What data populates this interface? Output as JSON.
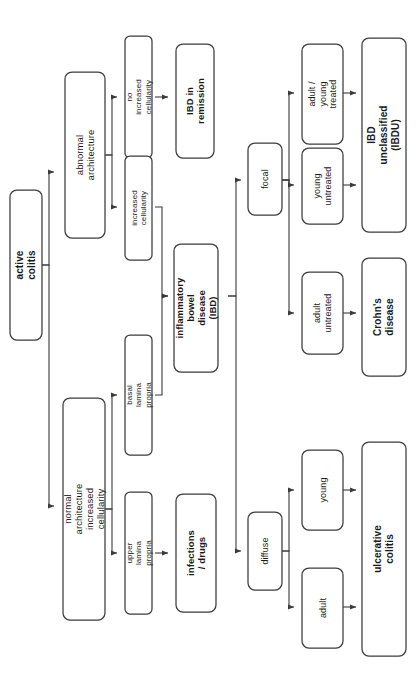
{
  "diagram": {
    "orientation": "rotated-90-ccw",
    "colors": {
      "background": "#ffffff",
      "node_stroke": "#3b3b3b",
      "node_fill": "#ffffff",
      "text": "#1a1a1a",
      "edge": "#3b3b3b"
    },
    "nodes": [
      {
        "id": "active_colitis",
        "label": "active colitis",
        "bold": true,
        "level": 0
      },
      {
        "id": "abnormal_arch",
        "label": "abnormal architecture",
        "bold": false,
        "level": 1
      },
      {
        "id": "normal_arch",
        "label": "normal architecture\nincreased cellularity",
        "bold": false,
        "level": 1
      },
      {
        "id": "no_incr_cell",
        "label": "no increased cellularity",
        "bold": false,
        "level": 2
      },
      {
        "id": "incr_cell",
        "label": "increased cellularity",
        "bold": false,
        "level": 2
      },
      {
        "id": "basal_lp",
        "label": "basal lamina propria",
        "bold": false,
        "level": 2
      },
      {
        "id": "upper_lp",
        "label": "upper lamina propria",
        "bold": false,
        "level": 2
      },
      {
        "id": "ibd_remission",
        "label": "IBD in remission",
        "bold": true,
        "level": 3
      },
      {
        "id": "ibd",
        "label": "inflammatory bowel\ndisease (IBD)",
        "bold": true,
        "level": 3
      },
      {
        "id": "infections_drugs",
        "label": "infections / drugs",
        "bold": true,
        "level": 3
      },
      {
        "id": "focal",
        "label": "focal",
        "bold": false,
        "level": 4
      },
      {
        "id": "diffuse",
        "label": "diffuse",
        "bold": false,
        "level": 4
      },
      {
        "id": "adult_young_treated",
        "label": "adult / young\ntreated",
        "bold": false,
        "level": 5
      },
      {
        "id": "young_untreated",
        "label": "young\nuntreated",
        "bold": false,
        "level": 5
      },
      {
        "id": "adult_untreated",
        "label": "adult\nuntreated",
        "bold": false,
        "level": 5
      },
      {
        "id": "young",
        "label": "young",
        "bold": false,
        "level": 5
      },
      {
        "id": "adult",
        "label": "adult",
        "bold": false,
        "level": 5
      },
      {
        "id": "ibdu",
        "label": "IBD unclassified (IBDU)",
        "bold": true,
        "level": 6
      },
      {
        "id": "crohns",
        "label": "Crohn's disease",
        "bold": true,
        "level": 6
      },
      {
        "id": "ulcerative_colitis",
        "label": "ulcerative colitis",
        "bold": true,
        "level": 6
      }
    ],
    "edges": [
      {
        "from": "active_colitis",
        "to": "abnormal_arch"
      },
      {
        "from": "active_colitis",
        "to": "normal_arch"
      },
      {
        "from": "abnormal_arch",
        "to": "no_incr_cell"
      },
      {
        "from": "abnormal_arch",
        "to": "incr_cell"
      },
      {
        "from": "normal_arch",
        "to": "basal_lp"
      },
      {
        "from": "normal_arch",
        "to": "upper_lp"
      },
      {
        "from": "no_incr_cell",
        "to": "ibd_remission"
      },
      {
        "from": "incr_cell",
        "to": "ibd"
      },
      {
        "from": "basal_lp",
        "to": "ibd"
      },
      {
        "from": "upper_lp",
        "to": "infections_drugs"
      },
      {
        "from": "ibd",
        "to": "focal"
      },
      {
        "from": "ibd",
        "to": "diffuse"
      },
      {
        "from": "focal",
        "to": "adult_young_treated"
      },
      {
        "from": "focal",
        "to": "young_untreated"
      },
      {
        "from": "focal",
        "to": "adult_untreated"
      },
      {
        "from": "diffuse",
        "to": "young"
      },
      {
        "from": "diffuse",
        "to": "adult"
      },
      {
        "from": "adult_young_treated",
        "to": "ibdu"
      },
      {
        "from": "young_untreated",
        "to": "ibdu"
      },
      {
        "from": "adult_untreated",
        "to": "crohns"
      },
      {
        "from": "young",
        "to": "ulcerative_colitis"
      },
      {
        "from": "adult",
        "to": "ulcerative_colitis"
      }
    ]
  }
}
